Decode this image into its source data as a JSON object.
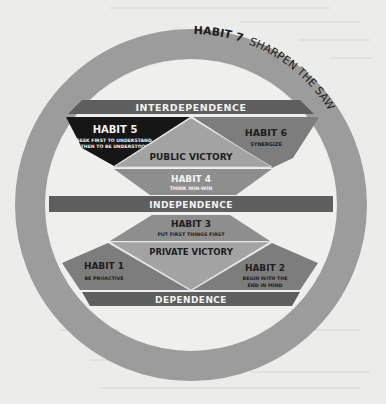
{
  "diagram": {
    "outer_ring": {
      "habit": "HABIT 7",
      "text": "SHARPEN THE SAW"
    },
    "bands": {
      "interdependence": "INTERDEPENDENCE",
      "independence": "INDEPENDENCE",
      "dependence": "DEPENDENCE"
    },
    "victories": {
      "public": "PUBLIC VICTORY",
      "private": "PRIVATE VICTORY"
    },
    "habits": [
      {
        "title": "HABIT 1",
        "line1": "BE PROACTIVE",
        "line2": ""
      },
      {
        "title": "HABIT 2",
        "line1": "BEGIN WITH THE",
        "line2": "END IN MIND"
      },
      {
        "title": "HABIT 3",
        "line1": "PUT FIRST THINGS FIRST",
        "line2": ""
      },
      {
        "title": "HABIT 4",
        "line1": "THINK WIN-WIN",
        "line2": ""
      },
      {
        "title": "HABIT 5",
        "line1": "SEEK FIRST TO UNDERSTAND,",
        "line2": "THEN TO BE UNDERSTOOD"
      },
      {
        "title": "HABIT 6",
        "line1": "SYNERGIZE",
        "line2": ""
      }
    ],
    "colors": {
      "page": "#ececeb",
      "ring": "#9c9c9c",
      "band": "#5e5e5e",
      "habit5": "#161616",
      "habit_mid": "#7d7d7d",
      "victory": "#a3a3a3",
      "habit4": "#8e8e8e",
      "white_text": "#f2f2f2",
      "dark_text": "#1e1e1e"
    }
  }
}
